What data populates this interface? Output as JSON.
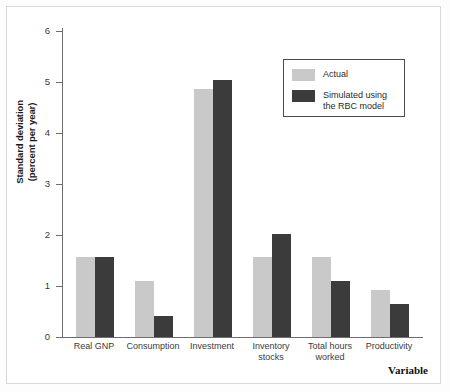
{
  "chart_data": {
    "type": "bar",
    "title": "",
    "xlabel": "Variable",
    "ylabel": "Standard deviation (percent per year)",
    "ylabel_line1": "Standard deviation",
    "ylabel_line2": "(percent per year)",
    "ylim": [
      0,
      6.6
    ],
    "yticks": [
      0,
      1,
      2,
      3,
      4,
      5,
      6
    ],
    "ytick_labels": [
      "0",
      "1",
      "2",
      "3",
      "4",
      "5",
      "6"
    ],
    "grid": false,
    "legend_position": "top-right",
    "categories": [
      "Real GNP",
      "Consumption",
      "Investment",
      "Inventory stocks",
      "Total hours worked",
      "Productivity"
    ],
    "category_lines": [
      [
        "Real GNP"
      ],
      [
        "Consumption"
      ],
      [
        "Investment"
      ],
      [
        "Inventory",
        "stocks"
      ],
      [
        "Total hours",
        "worked"
      ],
      [
        "Productivity"
      ]
    ],
    "series": [
      {
        "name": "Actual",
        "color": "#c9c9c9",
        "values": [
          1.7,
          1.2,
          5.3,
          1.7,
          1.7,
          1.0
        ]
      },
      {
        "name": "Simulated using the RBC model",
        "name_lines": [
          "Simulated using",
          "the RBC model"
        ],
        "color": "#3b3b3b",
        "values": [
          1.7,
          0.45,
          5.5,
          2.2,
          1.2,
          0.7
        ]
      }
    ]
  },
  "legend": {
    "entries": [
      {
        "label": "Actual",
        "line1": "Actual",
        "line2": "",
        "color": "#c9c9c9"
      },
      {
        "label": "Simulated using the RBC model",
        "line1": "Simulated using",
        "line2": "the RBC model",
        "color": "#3b3b3b"
      }
    ]
  },
  "axes": {
    "y_title_line1": "Standard deviation",
    "y_title_line2": "(percent per year)",
    "x_title": "Variable"
  }
}
